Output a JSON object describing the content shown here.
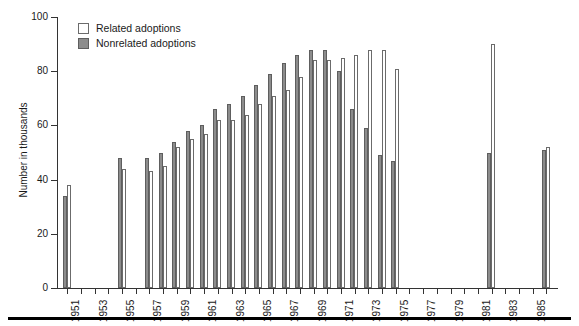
{
  "chart_data": {
    "type": "bar",
    "title": "",
    "xlabel": "",
    "ylabel": "Number in thousands",
    "ylim": [
      0,
      100
    ],
    "yticks": [
      0,
      20,
      40,
      60,
      80,
      100
    ],
    "grid": false,
    "legend_position": "top-left",
    "x": [
      1951,
      1952,
      1953,
      1954,
      1955,
      1956,
      1957,
      1958,
      1959,
      1960,
      1961,
      1962,
      1963,
      1964,
      1965,
      1966,
      1967,
      1968,
      1969,
      1970,
      1971,
      1972,
      1973,
      1974,
      1975,
      1976,
      1977,
      1978,
      1979,
      1980,
      1981,
      1982,
      1983,
      1984,
      1985,
      1986
    ],
    "xtick_labels": [
      "1951",
      "1953",
      "1955",
      "1957",
      "1959",
      "1961",
      "1963",
      "1965",
      "1967",
      "1969",
      "1971",
      "1973",
      "1975",
      "1977",
      "1979",
      "1981",
      "1983",
      "1985"
    ],
    "series": [
      {
        "name": "Related adoptions",
        "color": "#ffffff",
        "values": [
          38,
          null,
          null,
          null,
          44,
          null,
          43,
          45,
          52,
          55,
          57,
          62,
          62,
          64,
          68,
          71,
          73,
          78,
          84,
          84,
          85,
          86,
          88,
          88,
          81,
          null,
          null,
          null,
          null,
          null,
          null,
          90,
          null,
          null,
          null,
          52
        ]
      },
      {
        "name": "Nonrelated adoptions",
        "color": "#8c8c8c",
        "values": [
          34,
          null,
          null,
          null,
          48,
          null,
          48,
          50,
          54,
          58,
          60,
          66,
          68,
          71,
          75,
          79,
          83,
          86,
          88,
          88,
          80,
          66,
          59,
          49,
          47,
          null,
          null,
          null,
          null,
          null,
          null,
          50,
          null,
          null,
          null,
          51
        ]
      }
    ]
  },
  "legend": {
    "items": [
      {
        "label": "Related adoptions",
        "swatch": "related"
      },
      {
        "label": "Nonrelated adoptions",
        "swatch": "nonrelated"
      }
    ]
  },
  "axes": {
    "y_title": "Number in thousands"
  }
}
